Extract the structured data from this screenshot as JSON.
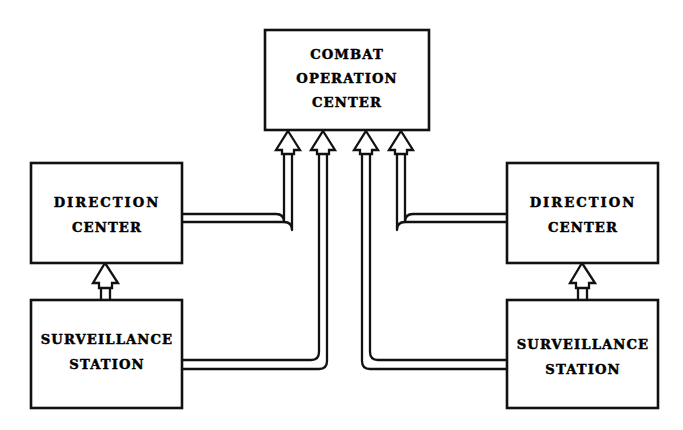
{
  "diagram": {
    "background_color": "#ffffff",
    "line_color": "#111111",
    "arrow_style": "hollow-outline-arrowhead",
    "nodes": [
      {
        "id": "combat-operation-center",
        "label_lines": [
          "COMBAT",
          "OPERATION",
          "CENTER"
        ],
        "line1": "COMBAT",
        "line2": "OPERATION",
        "line3": "CENTER"
      },
      {
        "id": "direction-center-left",
        "label_lines": [
          "DIRECTION",
          "CENTER"
        ],
        "line1": "DIRECTION",
        "line2": "CENTER"
      },
      {
        "id": "direction-center-right",
        "label_lines": [
          "DIRECTION",
          "CENTER"
        ],
        "line1": "DIRECTION",
        "line2": "CENTER"
      },
      {
        "id": "surveillance-station-left",
        "label_lines": [
          "SURVEILLANCE",
          "STATION"
        ],
        "line1": "SURVEILLANCE",
        "line2": "STATION"
      },
      {
        "id": "surveillance-station-right",
        "label_lines": [
          "SURVEILLANCE",
          "STATION"
        ],
        "line1": "SURVEILLANCE",
        "line2": "STATION"
      }
    ],
    "connections": [
      {
        "from": "surveillance-station-left",
        "to": "direction-center-left",
        "arrow": true
      },
      {
        "from": "surveillance-station-right",
        "to": "direction-center-right",
        "arrow": true
      },
      {
        "from": "direction-center-left",
        "to": "combat-operation-center",
        "arrow": true
      },
      {
        "from": "direction-center-right",
        "to": "combat-operation-center",
        "arrow": true
      },
      {
        "from": "surveillance-station-left",
        "to": "combat-operation-center",
        "arrow": true
      },
      {
        "from": "surveillance-station-right",
        "to": "combat-operation-center",
        "arrow": true
      }
    ]
  }
}
